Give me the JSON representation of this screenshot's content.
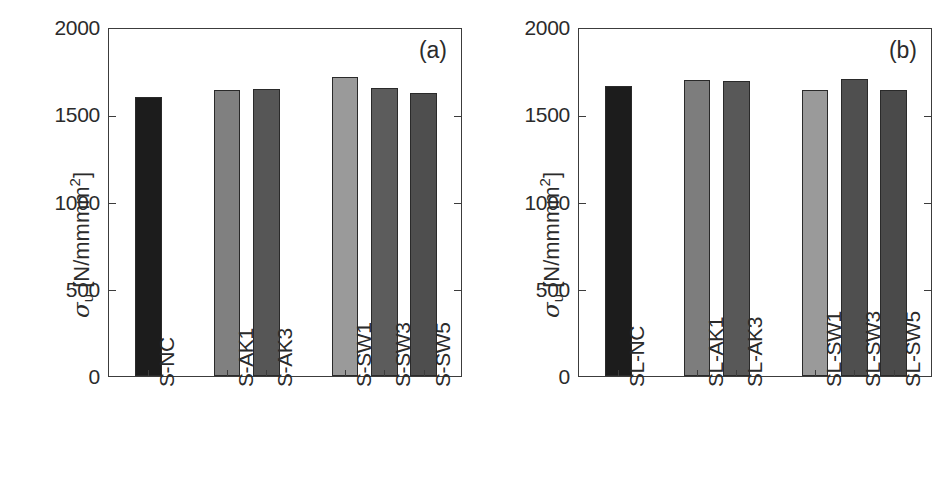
{
  "figure": {
    "width": 940,
    "height": 489,
    "background": "#ffffff"
  },
  "axis": {
    "y_title_symbol": "σ",
    "y_title_sub": "u",
    "y_title_unit_open": " [N/mm",
    "y_title_unit_sup": "2",
    "y_title_unit_close": "]",
    "y_title_plain": "σu [N/mm2]"
  },
  "chart_data": [
    {
      "type": "bar",
      "panel_label": "(a)",
      "title": "",
      "xlabel": "",
      "ylabel": "σu [N/mm2]",
      "ylim": [
        0,
        2000
      ],
      "yticks": [
        0,
        500,
        1000,
        1500,
        2000
      ],
      "ytick_labels": [
        "0",
        "500",
        "1000",
        "1500",
        "2000"
      ],
      "grid": false,
      "legend": "none",
      "categories": [
        "S-NC",
        "S-AK1",
        "S-AK3",
        "S-SW1",
        "S-SW3",
        "S-SW5"
      ],
      "values": [
        1600,
        1640,
        1645,
        1715,
        1650,
        1620
      ],
      "colors": [
        "#1c1c1c",
        "#808080",
        "#565656",
        "#9a9a9a",
        "#5c5c5c",
        "#4e4e4e"
      ],
      "slot_positions": [
        0,
        2,
        3,
        5,
        6,
        7
      ],
      "slot_count": 9
    },
    {
      "type": "bar",
      "panel_label": "(b)",
      "title": "",
      "xlabel": "",
      "ylabel": "σu [N/mm2]",
      "ylim": [
        0,
        2000
      ],
      "yticks": [
        0,
        500,
        1000,
        1500,
        2000
      ],
      "ytick_labels": [
        "0",
        "500",
        "1000",
        "1500",
        "2000"
      ],
      "grid": false,
      "legend": "none",
      "categories": [
        "SL-NC",
        "SL-AK1",
        "SL-AK3",
        "SL-SW1",
        "SL-SW3",
        "SL-SW5"
      ],
      "values": [
        1660,
        1695,
        1690,
        1640,
        1700,
        1640
      ],
      "colors": [
        "#1c1c1c",
        "#7d7d7d",
        "#585858",
        "#9a9a9a",
        "#4f4f4f",
        "#4a4a4a"
      ],
      "slot_positions": [
        0,
        2,
        3,
        5,
        6,
        7
      ],
      "slot_count": 9
    }
  ]
}
